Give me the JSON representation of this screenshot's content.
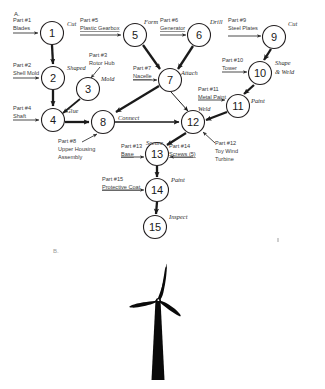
{
  "figure": {
    "panel_a_label": "A.",
    "panel_b_label": "B."
  },
  "diagram": {
    "type": "precedence-diagram",
    "nodes": [
      {
        "id": "1",
        "label": "1",
        "cx": 52,
        "cy": 33,
        "r": 11.5
      },
      {
        "id": "2",
        "label": "2",
        "cx": 53,
        "cy": 78,
        "r": 11.5
      },
      {
        "id": "3",
        "label": "3",
        "cx": 88,
        "cy": 89,
        "r": 11.5
      },
      {
        "id": "4",
        "label": "4",
        "cx": 53,
        "cy": 120,
        "r": 11.5
      },
      {
        "id": "5",
        "label": "5",
        "cx": 135,
        "cy": 35,
        "r": 11.5
      },
      {
        "id": "6",
        "label": "6",
        "cx": 199,
        "cy": 35,
        "r": 11.5
      },
      {
        "id": "7",
        "label": "7",
        "cx": 170,
        "cy": 80,
        "r": 11.5
      },
      {
        "id": "8",
        "label": "8",
        "cx": 103,
        "cy": 122,
        "r": 11.5
      },
      {
        "id": "9",
        "label": "9",
        "cx": 274,
        "cy": 37,
        "r": 11.5
      },
      {
        "id": "10",
        "label": "10",
        "cx": 260,
        "cy": 73,
        "r": 11.5
      },
      {
        "id": "11",
        "label": "11",
        "cx": 238,
        "cy": 106,
        "r": 11.5
      },
      {
        "id": "12",
        "label": "12",
        "cx": 193,
        "cy": 122,
        "r": 11.5
      },
      {
        "id": "13",
        "label": "13",
        "cx": 157,
        "cy": 154,
        "r": 11.5
      },
      {
        "id": "14",
        "label": "14",
        "cx": 157,
        "cy": 190,
        "r": 11.5
      },
      {
        "id": "15",
        "label": "15",
        "cx": 155,
        "cy": 227,
        "r": 11.5
      }
    ],
    "operations": [
      {
        "for": "1",
        "text": "Cut",
        "x": 67,
        "y": 24
      },
      {
        "for": "2",
        "text": "Shaped",
        "x": 67,
        "y": 68
      },
      {
        "for": "3",
        "text": "Mold",
        "x": 101,
        "y": 79
      },
      {
        "for": "4",
        "text": "Glue",
        "x": 66,
        "y": 111
      },
      {
        "for": "5",
        "text": "Form",
        "x": 144,
        "y": 22
      },
      {
        "for": "6",
        "text": "Drill",
        "x": 210,
        "y": 22
      },
      {
        "for": "7",
        "text": "Attach",
        "x": 182,
        "y": 73
      },
      {
        "for": "8",
        "text": "Connect",
        "x": 117,
        "y": 118
      },
      {
        "for": "9",
        "text": "Cut",
        "x": 287,
        "y": 24
      },
      {
        "for": "10",
        "text": "Shape",
        "x": 274,
        "y": 63
      },
      {
        "for": "10",
        "text": "& Weld",
        "x": 274,
        "y": 72
      },
      {
        "for": "11",
        "text": "Paint",
        "x": 252,
        "y": 101
      },
      {
        "for": "12",
        "text": "Weld",
        "x": 199,
        "y": 109
      },
      {
        "for": "13",
        "text": "Secure",
        "x": 147,
        "y": 143
      },
      {
        "for": "14",
        "text": "Paint",
        "x": 170,
        "y": 180
      },
      {
        "for": "15",
        "text": "Inspect",
        "x": 168,
        "y": 217
      }
    ],
    "parts": [
      {
        "num": "Part #1",
        "name": "Blades",
        "into": "1",
        "nx": 13,
        "ny": 25,
        "name_underline": false
      },
      {
        "num": "Part #2",
        "name": "Shell Mold",
        "into": "2",
        "nx": 13,
        "ny": 70,
        "name_underline": false
      },
      {
        "num": "Part #3",
        "name": "Rotor Hub",
        "into": "3",
        "nx": 91,
        "ny": 60,
        "name_underline": false
      },
      {
        "num": "Part #4",
        "name": "Shaft",
        "into": "4",
        "nx": 13,
        "ny": 112,
        "name_underline": false
      },
      {
        "num": "Part #5",
        "name": "Plastic Gearbox",
        "into": "5",
        "nx": 80,
        "ny": 22,
        "name_underline": true
      },
      {
        "num": "Part #6",
        "name": "Generator",
        "into": "6",
        "nx": 160,
        "ny": 22,
        "name_underline": true
      },
      {
        "num": "Part #7",
        "name": "Nacelle",
        "into": "7",
        "nx": 133,
        "ny": 73,
        "name_underline": true
      },
      {
        "num": "Part #8",
        "name": "Upper Housing",
        "into": "8",
        "nx": 58,
        "ny": 146,
        "name_underline": false,
        "extra": "Assembly"
      },
      {
        "num": "Part #9",
        "name": "Steel Plates",
        "into": "9",
        "nx": 228,
        "ny": 25,
        "name_underline": false
      },
      {
        "num": "Part #10",
        "name": "Tower",
        "into": "10",
        "nx": 222,
        "ny": 62,
        "name_underline": false
      },
      {
        "num": "Part #11",
        "name": "Metal Paint",
        "into": "11",
        "nx": 198,
        "ny": 92,
        "name_underline": false
      },
      {
        "num": "Part #12",
        "name": "Toy Wind",
        "into": "12",
        "nx": 214,
        "ny": 147,
        "name_underline": false,
        "extra": "Turbine"
      },
      {
        "num": "Part #13",
        "name": "Base",
        "into": "13",
        "nx": 121,
        "ny": 149,
        "name_underline": true
      },
      {
        "num": "Part #14",
        "name": "Screws (5)",
        "into": "13",
        "nx": 168,
        "ny": 149,
        "name_underline": false
      },
      {
        "num": "Part #15",
        "name": "Protective Coat",
        "into": "14",
        "nx": 102,
        "ny": 182,
        "name_underline": false
      }
    ],
    "edges": [
      {
        "from": "1",
        "to": "2"
      },
      {
        "from": "2",
        "to": "4"
      },
      {
        "from": "3",
        "to": "4"
      },
      {
        "from": "4",
        "to": "8"
      },
      {
        "from": "5",
        "to": "7"
      },
      {
        "from": "6",
        "to": "7"
      },
      {
        "from": "7",
        "to": "8"
      },
      {
        "from": "7",
        "to": "12"
      },
      {
        "from": "8",
        "to": "12"
      },
      {
        "from": "9",
        "to": "10"
      },
      {
        "from": "10",
        "to": "11"
      },
      {
        "from": "11",
        "to": "12"
      },
      {
        "from": "12",
        "to": "13"
      },
      {
        "from": "13",
        "to": "14"
      },
      {
        "from": "14",
        "to": "15"
      }
    ]
  },
  "illustration": {
    "name": "wind-turbine-silhouette",
    "color": "#0a0a0a"
  }
}
